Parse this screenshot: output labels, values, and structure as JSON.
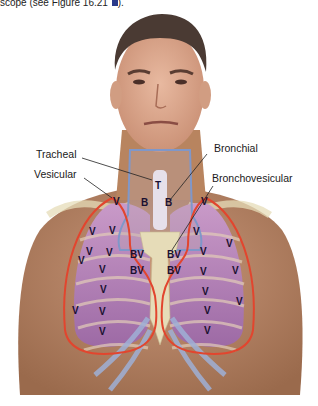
{
  "caption": {
    "text": "scope (see Figure 16.21 ",
    "tail": ").",
    "icon": "figure-link-icon"
  },
  "labels": {
    "tracheal": "Tracheal",
    "vesicular": "Vesicular",
    "bronchial": "Bronchial",
    "bronchovesicular": "Bronchovesicular"
  },
  "markers": {
    "tracheal": "T",
    "bronchial": "B",
    "bronchovesicular": "BV",
    "vesicular": "V"
  },
  "colors": {
    "skin": "#b98662",
    "lung": "#b07fb2",
    "region_outline": "#e2452e",
    "airway_outline": "#7f97c9",
    "bone": "#e6dcb8"
  }
}
